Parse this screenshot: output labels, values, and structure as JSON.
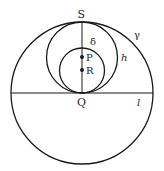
{
  "diagram": {
    "labels": {
      "S": "S",
      "delta": "δ",
      "gamma": "γ",
      "P": "P",
      "R": "R",
      "h": "h",
      "Q": "Q",
      "l": "l"
    },
    "shapes": {
      "outer_circle": {
        "cx": 82,
        "cy": 93,
        "r": 71,
        "name": "γ"
      },
      "middle_circle": {
        "cx": 82,
        "cy": 57.5,
        "r": 35.5,
        "name": "h"
      },
      "inner_circle": {
        "cx": 82,
        "cy": 70.5,
        "r": 22.5,
        "name": "δ"
      },
      "horizontal_line": {
        "x1": 11,
        "y1": 93,
        "x2": 153,
        "y2": 93,
        "name": "l"
      },
      "vertical_segment": {
        "x1": 82,
        "y1": 22,
        "x2": 82,
        "y2": 93,
        "from": "S",
        "to": "Q"
      },
      "points": [
        {
          "name": "P",
          "x": 82,
          "y": 57
        },
        {
          "name": "R",
          "x": 82,
          "y": 70
        }
      ]
    },
    "colors": {
      "stroke": "#1a1a1a",
      "background": "#ffffff"
    }
  }
}
